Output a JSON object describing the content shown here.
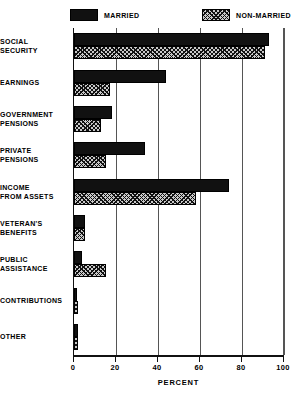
{
  "chart_data": {
    "type": "bar",
    "orientation": "horizontal",
    "title": "",
    "xlabel": "PERCENT",
    "ylabel": "",
    "xlim": [
      0,
      100
    ],
    "xticks": [
      0,
      20,
      40,
      60,
      80,
      100
    ],
    "grid": true,
    "legend_position": "top",
    "categories": [
      "SOCIAL\nSECURITY",
      "EARNINGS",
      "GOVERNMENT\nPENSIONS",
      "PRIVATE\nPENSIONS",
      "INCOME\nFROM ASSETS",
      "VETERAN'S\nBENEFITS",
      "PUBLIC\nASSISTANCE",
      "CONTRIBUTIONS",
      "OTHER"
    ],
    "series": [
      {
        "name": "MARRIED",
        "color": "#111111",
        "pattern": "solid",
        "values": [
          93,
          44,
          18,
          34,
          74,
          5,
          4,
          1,
          2
        ]
      },
      {
        "name": "NON-MARRIED",
        "color": "#c9c9c9",
        "pattern": "crosshatch",
        "values": [
          91,
          17,
          13,
          15,
          58,
          5,
          15,
          2,
          2
        ]
      }
    ]
  },
  "legend": {
    "entries": [
      {
        "label": "MARRIED"
      },
      {
        "label": "NON-MARRIED"
      }
    ]
  },
  "axis": {
    "xlabel": "PERCENT",
    "ticklabels": [
      "0",
      "20",
      "40",
      "60",
      "80",
      "100"
    ]
  }
}
